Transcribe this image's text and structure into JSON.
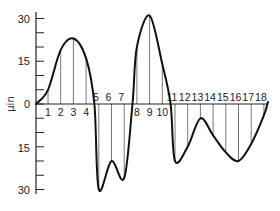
{
  "chart_data": {
    "type": "line",
    "title": "",
    "xlabel": "",
    "ylabel": "μin",
    "ylim": [
      -30,
      30
    ],
    "y_ticks": [
      30,
      15,
      0,
      15,
      30
    ],
    "y_tick_values": [
      30,
      15,
      0,
      -15,
      -30
    ],
    "y_minor_step": 5,
    "grid": false,
    "legend": null,
    "annotation": "Surface profile with ordinates 1–18 drawn to the mean line",
    "categories": [
      "1",
      "2",
      "3",
      "4",
      "5",
      "6",
      "7",
      "8",
      "9",
      "10",
      "11",
      "12",
      "13",
      "14",
      "15",
      "16",
      "17",
      "18"
    ],
    "series": [
      {
        "name": "profile ordinates",
        "values": [
          5,
          19,
          23,
          16,
          -30,
          -20,
          -26,
          20,
          31,
          14,
          -20,
          -15,
          -5,
          -11,
          -17,
          -20,
          -14,
          -4
        ]
      }
    ],
    "labels_above_axis": [
      "5",
      "6",
      "7",
      "11",
      "12",
      "13",
      "14",
      "15",
      "16",
      "17",
      "18"
    ],
    "labels_below_axis": [
      "1",
      "2",
      "3",
      "4",
      "8",
      "9",
      "10"
    ]
  },
  "axis": {
    "unit_label": "μin",
    "tick_labels": [
      "30",
      "15",
      "0",
      "15",
      "30"
    ]
  }
}
